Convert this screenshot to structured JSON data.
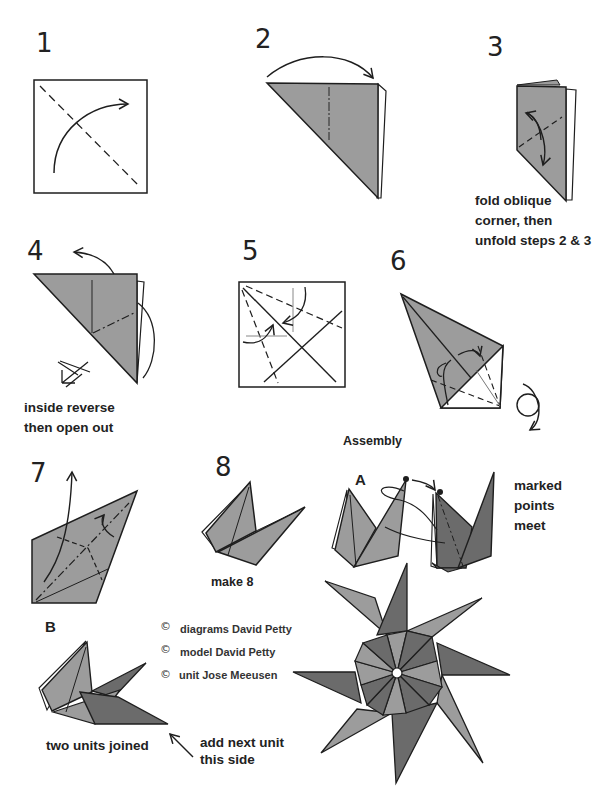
{
  "colors": {
    "paper_light": "#9c9c9c",
    "paper_dark": "#6b6b6b",
    "line": "#1e1e1e",
    "background": "#ffffff"
  },
  "steps": [
    {
      "number": "1",
      "caption": ""
    },
    {
      "number": "2",
      "caption": ""
    },
    {
      "number": "3",
      "caption_lines": [
        "fold oblique",
        "corner, then",
        "unfold steps 2 & 3"
      ]
    },
    {
      "number": "4",
      "caption_lines": [
        "inside reverse",
        "then open out"
      ]
    },
    {
      "number": "5",
      "caption": ""
    },
    {
      "number": "6",
      "caption": ""
    },
    {
      "number": "7",
      "caption": ""
    },
    {
      "number": "8",
      "caption": "make 8"
    }
  ],
  "assembly": {
    "title": "Assembly",
    "a": {
      "label": "A",
      "note_lines": [
        "marked",
        "points",
        "meet"
      ]
    },
    "b": {
      "label": "B",
      "caption": "two units joined",
      "arrow_note_lines": [
        "add next unit",
        "this side"
      ]
    }
  },
  "credits": [
    {
      "symbol": "©",
      "text": "diagrams David Petty"
    },
    {
      "symbol": "©",
      "text": "model David Petty"
    },
    {
      "symbol": "©",
      "text": "unit Jose Meeusen"
    }
  ]
}
